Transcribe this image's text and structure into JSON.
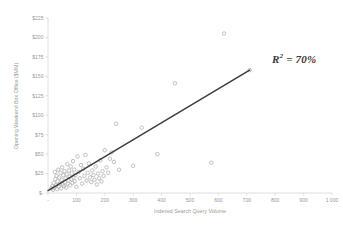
{
  "chart_data": {
    "type": "scatter",
    "title": "",
    "xlabel": "Indexed Search Query Volume",
    "ylabel": "Opening Weekend Box Office ($MM)",
    "xlim": [
      0,
      1000
    ],
    "ylim": [
      0,
      225
    ],
    "grid": false,
    "legend": null,
    "xticks": [
      0,
      100,
      200,
      300,
      400,
      500,
      600,
      700,
      800,
      900,
      1000
    ],
    "xtick_labels": [
      "-",
      "100",
      "200",
      "300",
      "400",
      "500",
      "600",
      "700",
      "800",
      "900",
      "1 000"
    ],
    "yticks": [
      0,
      25,
      50,
      75,
      100,
      125,
      150,
      175,
      200,
      225
    ],
    "ytick_labels": [
      "$-",
      "$25",
      "$50",
      "$75",
      "$100",
      "$125",
      "$150",
      "$175",
      "$200",
      "$225"
    ],
    "annotations": [
      {
        "name": "r-squared",
        "text_prefix": "R",
        "text_sup": "2",
        "text_suffix": " = 70%",
        "full_text": "R2 = 70%",
        "value": 70,
        "unit": "%"
      }
    ],
    "series": [
      {
        "name": "Movies",
        "type": "scatter",
        "marker_color": "#b9b9b9",
        "points": [
          [
            12,
            6
          ],
          [
            16,
            9
          ],
          [
            18,
            4
          ],
          [
            20,
            13
          ],
          [
            22,
            7
          ],
          [
            24,
            27
          ],
          [
            26,
            18
          ],
          [
            28,
            10
          ],
          [
            30,
            22
          ],
          [
            32,
            5
          ],
          [
            34,
            15
          ],
          [
            36,
            30
          ],
          [
            38,
            8
          ],
          [
            40,
            20
          ],
          [
            42,
            12
          ],
          [
            44,
            26
          ],
          [
            46,
            6
          ],
          [
            48,
            17
          ],
          [
            50,
            33
          ],
          [
            52,
            11
          ],
          [
            54,
            23
          ],
          [
            56,
            9
          ],
          [
            58,
            28
          ],
          [
            60,
            14
          ],
          [
            62,
            19
          ],
          [
            64,
            7
          ],
          [
            66,
            24
          ],
          [
            68,
            37
          ],
          [
            70,
            12
          ],
          [
            72,
            16
          ],
          [
            74,
            29
          ],
          [
            76,
            21
          ],
          [
            78,
            10
          ],
          [
            80,
            34
          ],
          [
            82,
            18
          ],
          [
            84,
            25
          ],
          [
            86,
            13
          ],
          [
            88,
            41
          ],
          [
            90,
            20
          ],
          [
            92,
            30
          ],
          [
            94,
            15
          ],
          [
            96,
            23
          ],
          [
            100,
            8
          ],
          [
            104,
            47
          ],
          [
            108,
            27
          ],
          [
            112,
            19
          ],
          [
            116,
            36
          ],
          [
            120,
            12
          ],
          [
            124,
            31
          ],
          [
            128,
            22
          ],
          [
            132,
            49
          ],
          [
            136,
            16
          ],
          [
            140,
            26
          ],
          [
            144,
            38
          ],
          [
            148,
            20
          ],
          [
            152,
            14
          ],
          [
            156,
            29
          ],
          [
            160,
            23
          ],
          [
            164,
            17
          ],
          [
            168,
            34
          ],
          [
            172,
            11
          ],
          [
            176,
            25
          ],
          [
            180,
            19
          ],
          [
            184,
            42
          ],
          [
            188,
            15
          ],
          [
            192,
            28
          ],
          [
            196,
            22
          ],
          [
            200,
            55
          ],
          [
            206,
            33
          ],
          [
            212,
            26
          ],
          [
            218,
            44
          ],
          [
            224,
            52
          ],
          [
            232,
            40
          ],
          [
            240,
            89
          ],
          [
            250,
            30
          ],
          [
            300,
            35
          ],
          [
            330,
            84
          ],
          [
            385,
            50
          ],
          [
            447,
            141
          ],
          [
            575,
            39
          ],
          [
            620,
            205
          ],
          [
            710,
            158
          ]
        ]
      },
      {
        "name": "Trendline",
        "type": "line",
        "line_color": "#3d3d3d",
        "points": [
          [
            0,
            3
          ],
          [
            710,
            158
          ]
        ],
        "r_squared": 0.7
      }
    ]
  }
}
